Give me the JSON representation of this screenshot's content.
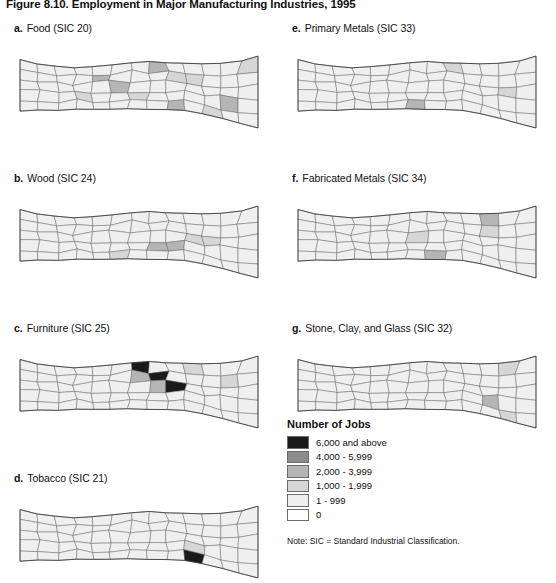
{
  "figure": {
    "number": "Figure 8.10.",
    "title": "Employment in Major Manufacturing Industries, 1995"
  },
  "panels": [
    {
      "letter": "a.",
      "label": "Food (SIC 20)",
      "col": "left",
      "row": 0
    },
    {
      "letter": "b.",
      "label": "Wood (SIC 24)",
      "col": "left",
      "row": 1
    },
    {
      "letter": "c.",
      "label": "Furniture (SIC 25)",
      "col": "left",
      "row": 2
    },
    {
      "letter": "d.",
      "label": "Tobacco (SIC 21)",
      "col": "left",
      "row": 3
    },
    {
      "letter": "e.",
      "label": "Primary Metals (SIC 33)",
      "col": "right",
      "row": 0
    },
    {
      "letter": "f.",
      "label": "Fabricated Metals (SIC 34)",
      "col": "right",
      "row": 1
    },
    {
      "letter": "g.",
      "label": "Stone, Clay, and Glass (SIC 32)",
      "col": "right",
      "row": 2
    }
  ],
  "legend": {
    "title": "Number of Jobs",
    "note": "Note: SIC = Standard Industrial Classification.",
    "classes": [
      {
        "label": "6,000 and above",
        "color": "#1a1a1a"
      },
      {
        "label": "4,000 - 5,999",
        "color": "#8c8c8c"
      },
      {
        "label": "2,000 - 3,999",
        "color": "#b5b5b5"
      },
      {
        "label": "1,000 - 1,999",
        "color": "#d6d6d6"
      },
      {
        "label": "1 - 999",
        "color": "#efefef"
      },
      {
        "label": "0",
        "color": "#ffffff"
      }
    ]
  },
  "map_data": {
    "type": "choropleth-series",
    "region": "North Carolina counties",
    "unit": "jobs",
    "class_colors": [
      "#1a1a1a",
      "#8c8c8c",
      "#b5b5b5",
      "#d6d6d6",
      "#efefef",
      "#ffffff"
    ],
    "default_fill": "#efefef",
    "panels": {
      "a": {
        "dark": [],
        "mid": [
          "c21",
          "c27",
          "c35",
          "c44",
          "c58"
        ],
        "light": [
          "c18",
          "c33",
          "c41",
          "c46",
          "c54",
          "c60"
        ]
      },
      "b": {
        "dark": [],
        "mid": [
          "c38",
          "c43"
        ],
        "light": [
          "c29",
          "c47",
          "c52"
        ]
      },
      "c": {
        "black": [
          "c30",
          "c36",
          "c42"
        ],
        "mid": [
          "c31",
          "c37"
        ],
        "light": [
          "c45",
          "c56"
        ]
      },
      "d": {
        "black": [
          "c49"
        ],
        "mid": [],
        "light": [
          "c48"
        ]
      },
      "e": {
        "mid": [
          "c34"
        ],
        "light": [
          "c40",
          "c57"
        ]
      },
      "f": {
        "mid": [
          "c39",
          "c50"
        ],
        "light": [
          "c32",
          "c51"
        ]
      },
      "g": {
        "mid": [
          "c53"
        ],
        "light": [
          "c55",
          "c59"
        ]
      }
    }
  }
}
